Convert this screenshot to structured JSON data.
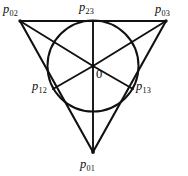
{
  "figure": {
    "type": "geometric-diagram",
    "background_color": "#ffffff",
    "stroke_color": "#111111",
    "canvas": {
      "width": 188,
      "height": 176
    },
    "shapes": {
      "triangle": {
        "name": "outer-triangle",
        "vertices": [
          {
            "id": "p02",
            "x": 20,
            "y": 21
          },
          {
            "id": "p03",
            "x": 166,
            "y": 21
          },
          {
            "id": "p01",
            "x": 93,
            "y": 152
          }
        ],
        "path": "M 20 21 L 166 21 L 93 152 Z"
      },
      "circle": {
        "name": "inscribed-circle",
        "cx": 93,
        "cy": 66,
        "r": 45.5
      },
      "radii": [
        {
          "name": "radius-to-p23",
          "from": "center",
          "to": "p23",
          "x1": 93,
          "y1": 66,
          "x2": 93,
          "y2": 21
        },
        {
          "name": "radius-to-p02",
          "from": "center",
          "to": "p02",
          "x1": 93,
          "y1": 66,
          "x2": 20,
          "y2": 21
        },
        {
          "name": "radius-to-p03",
          "from": "center",
          "to": "p03",
          "x1": 93,
          "y1": 66,
          "x2": 166,
          "y2": 21
        },
        {
          "name": "radius-to-p12",
          "from": "center",
          "to": "p12",
          "x1": 93,
          "y1": 66,
          "x2": 53,
          "y2": 89
        },
        {
          "name": "radius-to-p13",
          "from": "center",
          "to": "p13",
          "x1": 93,
          "y1": 66,
          "x2": 133,
          "y2": 89
        },
        {
          "name": "radius-to-p01",
          "from": "center",
          "to": "p01",
          "x1": 93,
          "y1": 66,
          "x2": 93,
          "y2": 152
        }
      ]
    },
    "points": [
      {
        "id": "p02",
        "symbol": "p",
        "subscript": "02",
        "x": 20,
        "y": 21,
        "on": "triangle-vertex"
      },
      {
        "id": "p23",
        "symbol": "p",
        "subscript": "23",
        "x": 93,
        "y": 21,
        "on": "circle-tangent-top"
      },
      {
        "id": "p03",
        "symbol": "p",
        "subscript": "03",
        "x": 166,
        "y": 21,
        "on": "triangle-vertex"
      },
      {
        "id": "p12",
        "symbol": "p",
        "subscript": "12",
        "x": 53,
        "y": 89,
        "on": "circle-tangent-left"
      },
      {
        "id": "p13",
        "symbol": "p",
        "subscript": "13",
        "x": 133,
        "y": 89,
        "on": "circle-tangent-right"
      },
      {
        "id": "p01",
        "symbol": "p",
        "subscript": "01",
        "x": 93,
        "y": 152,
        "on": "triangle-vertex"
      }
    ],
    "origin": {
      "id": "origin",
      "label": "0",
      "x": 93,
      "y": 66
    }
  }
}
